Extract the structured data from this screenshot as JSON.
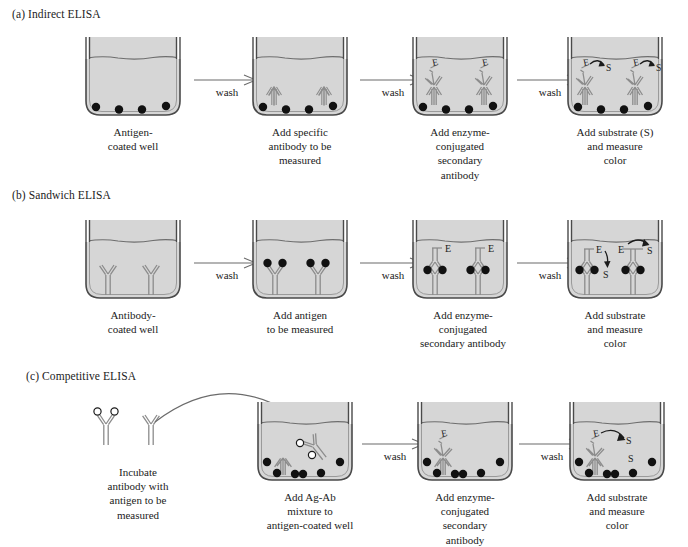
{
  "figure": {
    "title_a": "(a) Indirect ELISA",
    "title_b": "(b) Sandwich ELISA",
    "title_c": "(c) Competitive ELISA",
    "wash_label": "wash",
    "enzyme_label": "E",
    "substrate_label": "S",
    "colors": {
      "liquid": "#d6d6d6",
      "well_stroke": "#4a4a4a",
      "antigen_dot": "#111111",
      "antibody_stroke": "#8c8c8c",
      "antibody_fill": "#ffffff",
      "text": "#1b1b1b",
      "arrow": "#6b6b6b",
      "background": "#ffffff"
    }
  },
  "panel_a": {
    "heading": "(a) Indirect ELISA",
    "steps": [
      {
        "caption": "Antigen-\ncoated well",
        "contents": "antigen-coated well with four antigen dots"
      },
      {
        "caption": "Add specific\nantibody to be\nmeasured",
        "contents": "two primary antibodies bound to antigen dots"
      },
      {
        "caption": "Add enzyme-\nconjugated\nsecondary\nantibody",
        "contents": "secondary antibodies labeled E bound to primary antibodies"
      },
      {
        "caption": "Add substrate (S)\nand measure\ncolor",
        "contents": "enzyme E converts substrate S, shown by curved arrows"
      }
    ],
    "washes": [
      "wash",
      "wash",
      "wash"
    ]
  },
  "panel_b": {
    "heading": "(b) Sandwich ELISA",
    "steps": [
      {
        "caption": "Antibody-\ncoated well",
        "contents": "two capture antibodies coating the well"
      },
      {
        "caption": "Add antigen\nto be measured",
        "contents": "antigen dots bound to capture antibody arms"
      },
      {
        "caption": "Add enzyme-\nconjugated\nsecondary antibody",
        "contents": "inverted secondary antibodies labeled E completing the sandwich"
      },
      {
        "caption": "Add substrate\nand measure\ncolor",
        "contents": "enzyme E converts substrate S, shown by curved arrows"
      }
    ],
    "washes": [
      "wash",
      "wash",
      "wash"
    ]
  },
  "panel_c": {
    "heading": "(c) Competitive ELISA",
    "steps": [
      {
        "caption": "Incubate\nantibody with\nantigen to be\nmeasured",
        "contents": "free antibody bound to two open-circle antigens beside an unbound antibody"
      },
      {
        "caption": "Add Ag-Ab\nmixture to\nantigen-coated well",
        "contents": "antibody-antigen mixture added to antigen-coated well"
      },
      {
        "caption": "Add enzyme-\nconjugated\nsecondary\nantibody",
        "contents": "secondary antibody labeled E bound to well-bound antibody"
      },
      {
        "caption": "Add substrate\nand measure\ncolor",
        "contents": "enzyme E converts substrate S, shown by a curved arrow"
      }
    ],
    "washes": [
      "wash",
      "wash"
    ]
  }
}
